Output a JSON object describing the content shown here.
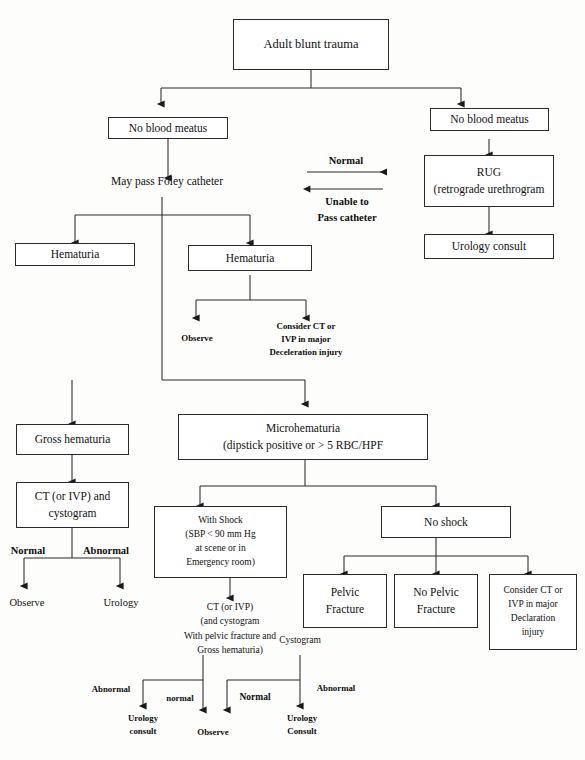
{
  "diagram": {
    "line_color": "#2a2a2a"
  },
  "nodes": {
    "root": "Adult blunt trauma",
    "no_blood_meatus_left": "No blood meatus",
    "no_blood_meatus_right": "No blood meatus",
    "may_pass_foley": "May pass Foley catheter",
    "rug_l1": "RUG",
    "rug_l2": "(retrograde urethrogram",
    "urology_consult_right": "Urology consult",
    "hematuria_left": "Hematuria",
    "hematuria_mid": "Hematuria",
    "observe_under_hematuria": "Observe",
    "consider_ct_l1": "Consider CT or",
    "consider_ct_l2": "IVP in major",
    "consider_ct_l3": "Deceleration injury",
    "gross_hematuria": "Gross hematuria",
    "ct_ivp_cystogram_l1": "CT (or IVP) and",
    "ct_ivp_cystogram_l2": "cystogram",
    "microhematuria_l1": "Microhematuria",
    "microhematuria_l2": "(dipstick positive or > 5 RBC/HPF",
    "observe_gross": "Observe",
    "urology_gross": "Urology",
    "with_shock_l1": "With Shock",
    "with_shock_l2": "(SBP < 90 mm Hg",
    "with_shock_l3": "at scene or in",
    "with_shock_l4": "Emergency room)",
    "ct_ivp_pelvic_l1": "CT (or IVP)",
    "ct_ivp_pelvic_l2": "(and cystogram",
    "ct_ivp_pelvic_l3": "With pelvic fracture and",
    "ct_ivp_pelvic_l4": "Gross hematuria)",
    "no_shock": "No shock",
    "pelvic_fracture_l1": "Pelvic",
    "pelvic_fracture_l2": "Fracture",
    "no_pelvic_fracture_l1": "No Pelvic",
    "no_pelvic_fracture_l2": "Fracture",
    "consider_ct2_l1": "Consider CT or",
    "consider_ct2_l2": "IVP in major",
    "consider_ct2_l3": "Declaration",
    "consider_ct2_l4": "injury",
    "cystogram_note": "Cystogram",
    "urology_consult_bottom_left_l1": "Urology",
    "urology_consult_bottom_left_l2": "consult",
    "observe_bottom": "Observe",
    "urology_consult_bottom_right_l1": "Urology",
    "urology_consult_bottom_right_l2": "Consult"
  },
  "edge_labels": {
    "normal_arrow": "Normal",
    "unable_l1": "Unable to",
    "unable_l2": "Pass catheter",
    "normal_gross": "Normal",
    "abnormal_gross": "Abnormal",
    "abnormal_bl": "Abnormal",
    "normal_lower_lc": "normal",
    "normal_lower_uc": "Normal",
    "abnormal_br": "Abnormal"
  }
}
